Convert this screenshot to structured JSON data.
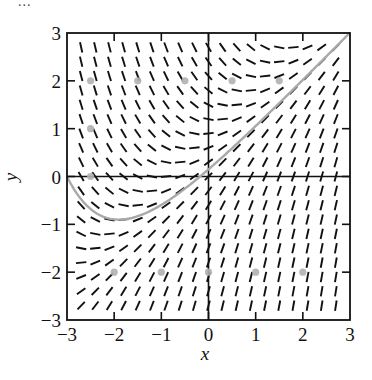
{
  "fragment_text": "...",
  "chart_data": {
    "type": "slope_field",
    "title": "",
    "xlabel": "x",
    "ylabel": "y",
    "xlim": [
      -3,
      3
    ],
    "ylim": [
      -3,
      3
    ],
    "x_ticks": [
      -3,
      -2,
      -1,
      0,
      1,
      2,
      3
    ],
    "y_ticks": [
      -3,
      -2,
      -1,
      0,
      1,
      2,
      3
    ],
    "x_tick_labels": [
      "−3",
      "−2",
      "−1",
      "0",
      "1",
      "2",
      "3"
    ],
    "y_tick_labels": [
      "−3",
      "−2",
      "−1",
      "0",
      "1",
      "2",
      "3"
    ],
    "grid": false,
    "axes_through_origin": true,
    "differential_equation": "dy/dx = x - y + 1",
    "slope_coefficients": {
      "x": 1,
      "y": -1,
      "const": 1
    },
    "field_grid": {
      "start": -2.7,
      "stop": 2.7,
      "step": 0.3
    },
    "solution_curve": {
      "equation": "y = x + C*exp(-x)",
      "C": 0.1494,
      "initial_point": [
        -3,
        0
      ],
      "x_range": [
        -3,
        3
      ],
      "color": "#a9a9a9"
    },
    "marked_points": [
      [
        -2.5,
        2
      ],
      [
        -1.5,
        2
      ],
      [
        -0.5,
        2
      ],
      [
        0.5,
        2
      ],
      [
        1.5,
        2
      ],
      [
        -2.5,
        1
      ],
      [
        -2.5,
        0
      ],
      [
        -2,
        -2
      ],
      [
        -1,
        -2
      ],
      [
        0,
        -2
      ],
      [
        1,
        -2
      ],
      [
        2,
        -2
      ]
    ],
    "marker_color": "#b0b0b0",
    "segment_color": "#111111"
  },
  "layout": {
    "plot_left": 67,
    "plot_top": 33,
    "plot_right": 350,
    "plot_bottom": 320
  }
}
